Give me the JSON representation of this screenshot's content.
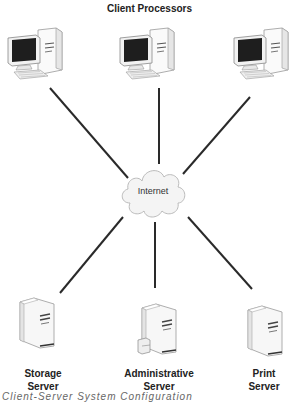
{
  "diagram": {
    "title": "Client Processors",
    "center": {
      "label": "Internet",
      "icon": "cloud-icon"
    },
    "clients": [
      {
        "id": "client-1",
        "icon": "desktop-computer-icon"
      },
      {
        "id": "client-2",
        "icon": "desktop-computer-icon"
      },
      {
        "id": "client-3",
        "icon": "desktop-computer-icon"
      }
    ],
    "servers": [
      {
        "id": "storage",
        "line1": "Storage",
        "line2": "Server",
        "icon": "server-tower-icon"
      },
      {
        "id": "admin",
        "line1": "Administrative",
        "line2": "Server",
        "icon": "server-tower-icon"
      },
      {
        "id": "print",
        "line1": "Print",
        "line2": "Server",
        "icon": "server-tower-icon"
      }
    ],
    "caption": "Client-Server System Configuration",
    "colors": {
      "line": "#2a2a2a",
      "cloud_fill": "#f4f4f4",
      "cloud_stroke": "#bbbbbb",
      "screen": "#1e1e1e"
    }
  }
}
